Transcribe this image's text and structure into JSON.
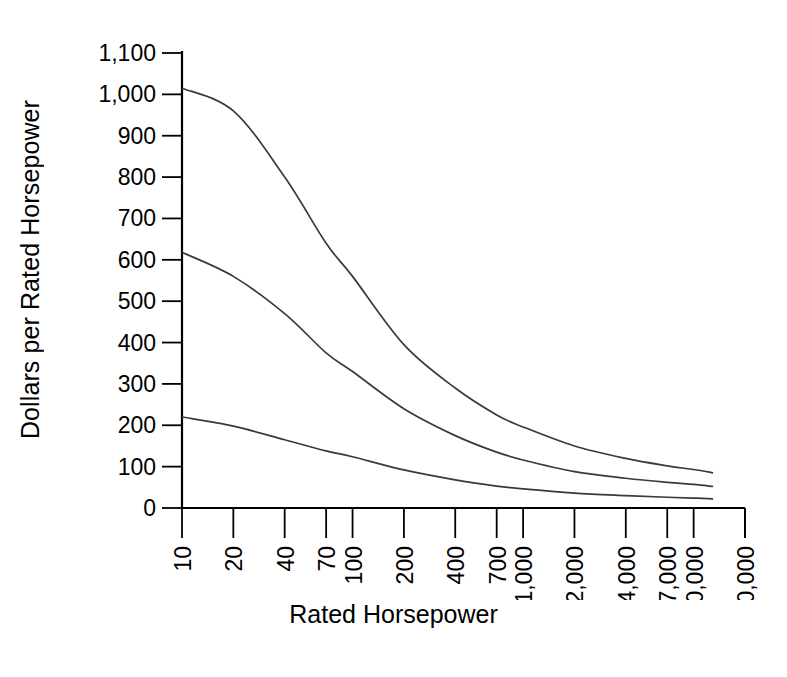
{
  "chart_data": {
    "type": "line",
    "title": "",
    "xlabel": "Rated Horsepower",
    "ylabel": "Dollars per Rated Horsepower",
    "xscale": "log",
    "yscale": "linear",
    "xlim": [
      9,
      22000
    ],
    "ylim": [
      0,
      1100
    ],
    "grid": false,
    "legend": null,
    "x_tick_labels": [
      "10",
      "20",
      "40",
      "70",
      "100",
      "200",
      "400",
      "700",
      "1,000",
      "2,000",
      "4,000",
      "7,000",
      "10,000",
      "20,000"
    ],
    "x_tick_values": [
      10,
      20,
      40,
      70,
      100,
      200,
      400,
      700,
      1000,
      2000,
      4000,
      7000,
      10000,
      20000
    ],
    "y_tick_labels": [
      "0",
      "100",
      "200",
      "300",
      "400",
      "500",
      "600",
      "700",
      "800",
      "900",
      "1,000",
      "1,100"
    ],
    "y_tick_values": [
      0,
      100,
      200,
      300,
      400,
      500,
      600,
      700,
      800,
      900,
      1000,
      1100
    ],
    "x": [
      10,
      20,
      40,
      70,
      100,
      200,
      400,
      700,
      1000,
      2000,
      4000,
      7000,
      10000,
      13000
    ],
    "series": [
      {
        "name": "upper-curve",
        "values": [
          1015,
          960,
          800,
          640,
          560,
          395,
          290,
          225,
          196,
          150,
          120,
          102,
          93,
          85
        ]
      },
      {
        "name": "middle-curve",
        "values": [
          618,
          560,
          470,
          375,
          330,
          240,
          175,
          135,
          116,
          88,
          72,
          62,
          57,
          52
        ]
      },
      {
        "name": "lower-curve",
        "values": [
          220,
          198,
          165,
          138,
          124,
          92,
          68,
          53,
          46,
          36,
          30,
          26,
          24,
          22
        ]
      }
    ],
    "annotations": []
  },
  "colors": {
    "curve": "#3a3a3a",
    "axis": "#000000",
    "background": "#ffffff"
  }
}
